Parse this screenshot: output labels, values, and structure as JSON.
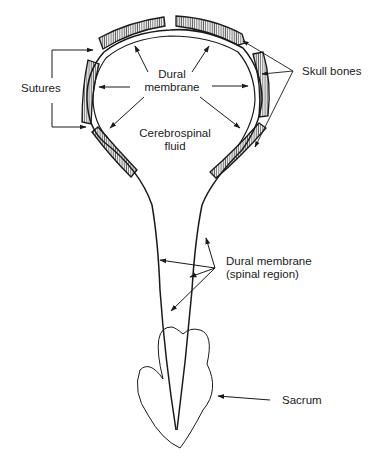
{
  "diagram": {
    "type": "anatomical-illustration",
    "labels": {
      "sutures": "Sutures",
      "skull_bones": "Skull bones",
      "dural_membrane_line1": "Dural",
      "dural_membrane_line2": "membrane",
      "csf_line1": "Cerebrospinal",
      "csf_line2": "fluid",
      "spinal_dura_line1": "Dural membrane",
      "spinal_dura_line2": "(spinal region)",
      "sacrum": "Sacrum"
    },
    "colors": {
      "stroke": "#1a1a1a",
      "bone_fill": "#e6e6e6",
      "background": "#ffffff"
    },
    "parts": [
      "skull bones",
      "sutures",
      "dural membrane (cranial)",
      "cerebrospinal fluid",
      "dural membrane (spinal region)",
      "sacrum"
    ]
  }
}
